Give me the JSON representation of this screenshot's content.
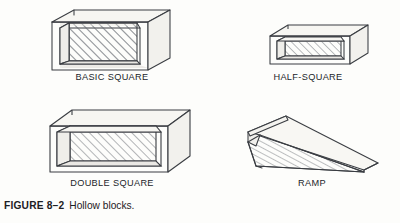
{
  "figure": {
    "caption_id": "FIGURE 8–2",
    "caption_text": "Hollow blocks.",
    "background_color": "#fdfdfb",
    "line_color": "#3a3d42",
    "hatch_color": "#6e7277"
  },
  "blocks": [
    {
      "id": "basic-square",
      "label": "BASIC SQUARE",
      "shape": "hollow-cube",
      "description": "Square hollow block, open front and back, interior walls hatched"
    },
    {
      "id": "half-square",
      "label": "HALF-SQUARE",
      "shape": "hollow-rectangular-low",
      "description": "Half height hollow block, open front and back, interior hatched"
    },
    {
      "id": "double-square",
      "label": "DOUBLE SQUARE",
      "shape": "hollow-rectangular-long",
      "description": "Double length hollow block, open front and back, interior hatched"
    },
    {
      "id": "ramp",
      "label": "RAMP",
      "shape": "wedge",
      "description": "Triangular wedge ramp block, hollow underside, tapers to a point"
    }
  ]
}
